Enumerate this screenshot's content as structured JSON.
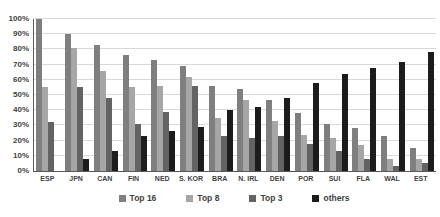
{
  "chart_data": {
    "type": "bar",
    "title": "",
    "categories": [
      "ESP",
      "JPN",
      "CAN",
      "FIN",
      "NED",
      "S. KOR",
      "BRA",
      "N. IRL",
      "DEN",
      "POR",
      "SUI",
      "FLA",
      "WAL",
      "EST"
    ],
    "series": [
      {
        "name": "Top 16",
        "color": "#7f7f7f",
        "values": [
          100,
          90,
          83,
          76,
          73,
          69,
          56,
          54,
          47,
          38,
          31,
          28,
          23,
          15
        ]
      },
      {
        "name": "Top 8",
        "color": "#a6a6a6",
        "values": [
          55,
          81,
          66,
          55,
          56,
          62,
          35,
          47,
          33,
          24,
          22,
          17,
          8,
          8
        ]
      },
      {
        "name": "Top 3",
        "color": "#636363",
        "values": [
          32,
          55,
          48,
          31,
          39,
          56,
          23,
          22,
          23,
          18,
          13,
          8,
          3,
          5
        ]
      },
      {
        "name": "others",
        "color": "#1c1c1c",
        "values": [
          0,
          8,
          13,
          23,
          26,
          29,
          40,
          42,
          48,
          58,
          64,
          68,
          72,
          78
        ]
      }
    ],
    "ylim": [
      0,
      100
    ],
    "yticks": [
      "0%",
      "10%",
      "20%",
      "30%",
      "40%",
      "50%",
      "60%",
      "70%",
      "80%",
      "90%",
      "100%"
    ],
    "grid": true,
    "legend_position": "bottom",
    "axis_color": "#595959",
    "gridline_color": "#d9d9d9",
    "text_color": "#3f3f3f"
  }
}
